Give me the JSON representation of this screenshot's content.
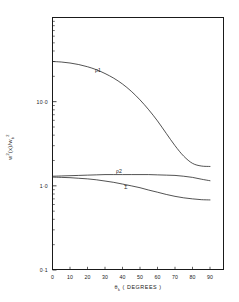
{
  "chart_data": {
    "type": "line",
    "title": "",
    "xlabel": "θ k ( DEGREES )",
    "xlabel_main": "θ",
    "xlabel_sub": "k",
    "xlabel_unit": "( DEGREES )",
    "ylabel": "w²(x)/w b²",
    "ylabel_parts": {
      "w1": "w",
      "sup1": "2",
      "arg": "(x)/",
      "w2": "w",
      "sub": "b",
      "sup2": "2"
    },
    "xscale": "linear",
    "yscale": "log",
    "xlim": [
      0,
      90
    ],
    "ylim": [
      0.1,
      100
    ],
    "grid": false,
    "legend": "inline-annotations",
    "xticks": [
      0,
      10,
      20,
      30,
      40,
      50,
      60,
      70,
      80,
      90
    ],
    "xticklabels": [
      "0",
      "10",
      "20",
      "30",
      "40",
      "50",
      "60",
      "70",
      "80",
      "90"
    ],
    "yticks": [
      0.1,
      1.0,
      10.0
    ],
    "yticklabels": [
      "0·1",
      "1·0",
      "10·0"
    ],
    "yminorticks": [
      0.2,
      0.3,
      0.4,
      0.5,
      0.6,
      0.7,
      0.8,
      0.9,
      2,
      3,
      4,
      5,
      6,
      7,
      8,
      9,
      20,
      30,
      40,
      50,
      60,
      70,
      80,
      90
    ],
    "series": [
      {
        "name": "ρ1",
        "label": "ρ1",
        "label_at": {
          "x": 26,
          "y": 24.0
        },
        "color": "#1a1a1a",
        "x": [
          0,
          5,
          10,
          15,
          20,
          25,
          30,
          35,
          40,
          45,
          50,
          55,
          60,
          65,
          70,
          75,
          80,
          85,
          90
        ],
        "y": [
          30.0,
          29.6,
          28.8,
          27.6,
          26.0,
          24.0,
          21.6,
          19.0,
          16.2,
          13.3,
          10.5,
          8.0,
          5.9,
          4.2,
          3.0,
          2.25,
          1.85,
          1.72,
          1.7
        ]
      },
      {
        "name": "ρ2",
        "label": "ρ2",
        "label_at": {
          "x": 38,
          "y": 1.52
        },
        "color": "#1a1a1a",
        "x": [
          0,
          5,
          10,
          15,
          20,
          25,
          30,
          35,
          40,
          45,
          50,
          55,
          60,
          65,
          70,
          75,
          80,
          85,
          90
        ],
        "y": [
          1.3,
          1.31,
          1.32,
          1.33,
          1.34,
          1.35,
          1.36,
          1.36,
          1.36,
          1.36,
          1.36,
          1.36,
          1.35,
          1.34,
          1.33,
          1.3,
          1.26,
          1.2,
          1.15
        ]
      },
      {
        "name": "Σ",
        "label": "Σ",
        "label_at": {
          "x": 42,
          "y": 0.98
        },
        "color": "#1a1a1a",
        "x": [
          0,
          5,
          10,
          15,
          20,
          25,
          30,
          35,
          40,
          45,
          50,
          55,
          60,
          65,
          70,
          75,
          80,
          85,
          90
        ],
        "y": [
          1.27,
          1.26,
          1.25,
          1.23,
          1.21,
          1.18,
          1.14,
          1.1,
          1.05,
          1.0,
          0.95,
          0.89,
          0.84,
          0.79,
          0.75,
          0.72,
          0.7,
          0.685,
          0.68
        ]
      }
    ]
  },
  "axis": {
    "x_title_theta": "θ",
    "x_title_sub": "k",
    "x_title_unit": "( DEGREES )"
  }
}
